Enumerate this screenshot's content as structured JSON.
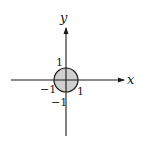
{
  "diagram": {
    "type": "coordinate-plane-with-disk",
    "axes": {
      "x_label": "x",
      "y_label": "y"
    },
    "ticks": {
      "y_pos": "1",
      "y_neg": "−1",
      "x_pos": "1",
      "x_neg": "−1"
    },
    "region": {
      "shape": "disk",
      "center": [
        0,
        0
      ],
      "radius": 1,
      "fill": "#cfcfcf",
      "stroke": "#1a1a1a"
    },
    "colors": {
      "axis": "#1a1a1a",
      "background": "#ffffff"
    }
  }
}
